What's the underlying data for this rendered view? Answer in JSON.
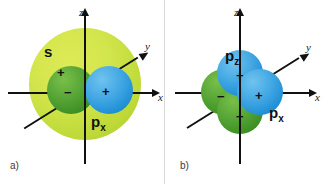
{
  "figure": {
    "background_color": "#ffffff",
    "width": 329,
    "height": 184
  },
  "colors": {
    "s_orbital": "#c6de33",
    "positive_lobe": "#2f9bdc",
    "negative_lobe": "#4f9e2f",
    "axis": "#111111",
    "text": "#111111"
  },
  "panels": [
    {
      "tag": "a)",
      "axes": {
        "z": "z",
        "x": "x",
        "y": "y"
      },
      "orbitals": [
        {
          "name": "s",
          "label": "s",
          "sign": "+",
          "color": "#c6de33",
          "shape": "sphere"
        },
        {
          "name": "p_x",
          "label": "p",
          "subscript": "x",
          "shape": "dumbbell",
          "lobes": [
            {
              "sign": "−",
              "color": "#4f9e2f",
              "side": "left"
            },
            {
              "sign": "+",
              "color": "#2f9bdc",
              "side": "right"
            }
          ]
        }
      ]
    },
    {
      "tag": "b)",
      "axes": {
        "z": "z",
        "x": "x",
        "y": "y"
      },
      "orbitals": [
        {
          "name": "p_z",
          "label": "p",
          "subscript": "z",
          "shape": "dumbbell",
          "lobes": [
            {
              "sign": "+",
              "color": "#2f9bdc",
              "side": "top"
            },
            {
              "sign": "−",
              "color": "#4f9e2f",
              "side": "bottom"
            }
          ]
        },
        {
          "name": "p_x",
          "label": "p",
          "subscript": "x",
          "shape": "dumbbell",
          "lobes": [
            {
              "sign": "−",
              "color": "#4f9e2f",
              "side": "left"
            },
            {
              "sign": "+",
              "color": "#2f9bdc",
              "side": "right"
            }
          ]
        }
      ]
    }
  ]
}
